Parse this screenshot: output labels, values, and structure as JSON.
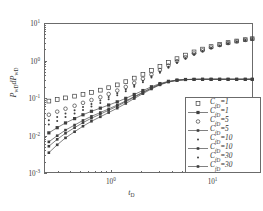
{
  "chart_data": {
    "type": "scatter",
    "title": "",
    "xlabel": "t_D",
    "ylabel": "P_wD dP_wD",
    "xscale": "log",
    "yscale": "log",
    "xlim": [
      0.22,
      25
    ],
    "ylim": [
      0.001,
      10
    ],
    "grid": false,
    "legend_position": "lower right",
    "xticks": [
      {
        "value": 1,
        "label_base": "10",
        "label_exp": "0"
      },
      {
        "value": 10,
        "label_base": "10",
        "label_exp": "1"
      }
    ],
    "yticks": [
      {
        "value": 10,
        "label_base": "10",
        "label_exp": "1"
      },
      {
        "value": 1,
        "label_base": "10",
        "label_exp": "0"
      },
      {
        "value": 0.1,
        "label_base": "10",
        "label_exp": "-1"
      },
      {
        "value": 0.01,
        "label_base": "10",
        "label_exp": "-2"
      },
      {
        "value": 0.001,
        "label_base": "10",
        "label_exp": "-3"
      }
    ],
    "series": [
      {
        "name": "C_fD=1 (markers)",
        "legend_label_base": "C",
        "legend_label_sub": "fD",
        "legend_label_value": "=1",
        "marker": "open-square",
        "line": false,
        "x": [
          0.24,
          0.29,
          0.35,
          0.43,
          0.52,
          0.63,
          0.77,
          0.93,
          1.13,
          1.37,
          1.66,
          2.02,
          2.45,
          2.97,
          3.6,
          4.37,
          5.3,
          6.43,
          7.8,
          9.46,
          11.5,
          13.9,
          16.9,
          20.5,
          24.0
        ],
        "y": [
          0.088,
          0.097,
          0.107,
          0.119,
          0.133,
          0.15,
          0.172,
          0.2,
          0.238,
          0.29,
          0.36,
          0.455,
          0.58,
          0.74,
          0.94,
          1.19,
          1.48,
          1.8,
          2.14,
          2.5,
          2.86,
          3.2,
          3.52,
          3.82,
          4.05
        ]
      },
      {
        "name": "C_fD=1 (line+markers)",
        "legend_label_base": "C",
        "legend_label_sub": "fD",
        "legend_label_value": "=1",
        "marker": "filled-square",
        "line": true,
        "x": [
          0.24,
          0.29,
          0.35,
          0.43,
          0.52,
          0.63,
          0.77,
          0.93,
          1.13,
          1.37,
          1.66,
          2.02,
          2.45,
          2.97,
          3.6,
          4.37,
          5.3,
          6.43,
          7.8,
          9.46,
          11.5,
          13.9,
          16.9,
          20.5,
          24.0
        ],
        "y": [
          0.0125,
          0.0172,
          0.023,
          0.03,
          0.038,
          0.047,
          0.057,
          0.069,
          0.084,
          0.104,
          0.132,
          0.168,
          0.212,
          0.258,
          0.296,
          0.32,
          0.331,
          0.335,
          0.336,
          0.336,
          0.336,
          0.336,
          0.336,
          0.336,
          0.336
        ]
      },
      {
        "name": "C_fD=5 (markers)",
        "legend_label_base": "C",
        "legend_label_sub": "fD",
        "legend_label_value": "=5",
        "marker": "open-circle",
        "line": false,
        "x": [
          0.24,
          0.29,
          0.35,
          0.43,
          0.52,
          0.63,
          0.77,
          0.93,
          1.13,
          1.37,
          1.66,
          2.02,
          2.45,
          2.97,
          3.6,
          4.37,
          5.3,
          6.43,
          7.8,
          9.46,
          11.5,
          13.9,
          16.9,
          20.5,
          24.0
        ],
        "y": [
          0.038,
          0.046,
          0.055,
          0.066,
          0.079,
          0.094,
          0.112,
          0.136,
          0.168,
          0.21,
          0.268,
          0.345,
          0.45,
          0.59,
          0.78,
          1.02,
          1.3,
          1.63,
          1.98,
          2.36,
          2.74,
          3.1,
          3.44,
          3.76,
          4.0
        ]
      },
      {
        "name": "C_fD=5 (line+markers)",
        "legend_label_base": "C",
        "legend_label_sub": "fD",
        "legend_label_value": "=5",
        "marker": "filled-square-small",
        "line": true,
        "x": [
          0.24,
          0.29,
          0.35,
          0.43,
          0.52,
          0.63,
          0.77,
          0.93,
          1.13,
          1.37,
          1.66,
          2.02,
          2.45,
          2.97,
          3.6,
          4.37,
          5.3,
          6.43,
          7.8,
          9.46,
          11.5,
          13.9,
          16.9,
          20.5,
          24.0
        ],
        "y": [
          0.0072,
          0.0105,
          0.0148,
          0.0202,
          0.0268,
          0.0345,
          0.0435,
          0.0545,
          0.069,
          0.089,
          0.116,
          0.152,
          0.198,
          0.248,
          0.29,
          0.317,
          0.33,
          0.334,
          0.336,
          0.336,
          0.336,
          0.336,
          0.336,
          0.336,
          0.336
        ]
      },
      {
        "name": "C_fD=10 (markers)",
        "legend_label_base": "C",
        "legend_label_sub": "fD",
        "legend_label_value": "=10",
        "marker": "dot",
        "line": false,
        "x": [
          0.24,
          0.29,
          0.35,
          0.43,
          0.52,
          0.63,
          0.77,
          0.93,
          1.13,
          1.37,
          1.66,
          2.02,
          2.45,
          2.97,
          3.6,
          4.37,
          5.3,
          6.43,
          7.8,
          9.46,
          11.5,
          13.9,
          16.9,
          20.5,
          24.0
        ],
        "y": [
          0.027,
          0.033,
          0.041,
          0.05,
          0.061,
          0.074,
          0.091,
          0.113,
          0.142,
          0.18,
          0.234,
          0.305,
          0.404,
          0.538,
          0.72,
          0.955,
          1.23,
          1.56,
          1.91,
          2.3,
          2.68,
          3.05,
          3.4,
          3.72,
          3.96
        ]
      },
      {
        "name": "C_fD=10 (line+markers)",
        "legend_label_base": "C",
        "legend_label_sub": "fD",
        "legend_label_value": "=10",
        "marker": "filled-square-small",
        "line": true,
        "x": [
          0.24,
          0.29,
          0.35,
          0.43,
          0.52,
          0.63,
          0.77,
          0.93,
          1.13,
          1.37,
          1.66,
          2.02,
          2.45,
          2.97,
          3.6,
          4.37,
          5.3,
          6.43,
          7.8,
          9.46,
          11.5,
          13.9,
          16.9,
          20.5,
          24.0
        ],
        "y": [
          0.0055,
          0.0084,
          0.0122,
          0.0172,
          0.0234,
          0.0308,
          0.0395,
          0.0502,
          0.0645,
          0.0845,
          0.112,
          0.148,
          0.194,
          0.245,
          0.288,
          0.316,
          0.329,
          0.334,
          0.336,
          0.336,
          0.336,
          0.336,
          0.336,
          0.336,
          0.336
        ]
      },
      {
        "name": "C_fD=30 (markers)",
        "legend_label_base": "C",
        "legend_label_sub": "fD",
        "legend_label_value": "=30",
        "marker": "dot",
        "line": false,
        "x": [
          0.24,
          0.29,
          0.35,
          0.43,
          0.52,
          0.63,
          0.77,
          0.93,
          1.13,
          1.37,
          1.66,
          2.02,
          2.45,
          2.97,
          3.6,
          4.37,
          5.3,
          6.43,
          7.8,
          9.46,
          11.5,
          13.9,
          16.9,
          20.5,
          24.0
        ],
        "y": [
          0.021,
          0.026,
          0.033,
          0.041,
          0.051,
          0.063,
          0.078,
          0.098,
          0.125,
          0.161,
          0.212,
          0.28,
          0.375,
          0.505,
          0.682,
          0.915,
          1.19,
          1.51,
          1.86,
          2.25,
          2.63,
          3.0,
          3.36,
          3.68,
          3.92
        ]
      },
      {
        "name": "C_fD=30 (line+markers)",
        "legend_label_base": "C",
        "legend_label_sub": "fD",
        "legend_label_value": "=30",
        "marker": "filled-square-small",
        "line": true,
        "x": [
          0.24,
          0.29,
          0.35,
          0.43,
          0.52,
          0.63,
          0.77,
          0.93,
          1.13,
          1.37,
          1.66,
          2.02,
          2.45,
          2.97,
          3.6,
          4.37,
          5.3,
          6.43,
          7.8,
          9.46,
          11.5,
          13.9,
          16.9,
          20.5,
          24.0
        ],
        "y": [
          0.0037,
          0.006,
          0.0092,
          0.0134,
          0.0188,
          0.0255,
          0.0335,
          0.0435,
          0.057,
          0.076,
          0.103,
          0.139,
          0.185,
          0.238,
          0.283,
          0.313,
          0.328,
          0.334,
          0.336,
          0.336,
          0.336,
          0.336,
          0.336,
          0.336,
          0.336
        ]
      }
    ]
  },
  "axes": {
    "x_title_base": "t",
    "x_title_sub": "D",
    "y_title_part1": "P",
    "y_title_sub1": "wD",
    "y_title_part2": "dP",
    "y_title_sub2": "wD"
  },
  "colors": {
    "axis": "#6b6b6b",
    "marker": "#3f3f3f",
    "line": "#4a4a4a",
    "background": "#ffffff"
  }
}
